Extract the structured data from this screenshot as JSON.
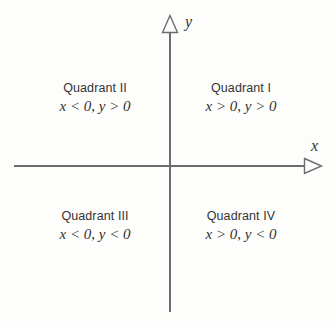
{
  "figure": {
    "background_color": "#fdfdfc",
    "axis_color": "#6d6d6d",
    "text_color": "#333333"
  },
  "axes": {
    "x": {
      "label": "x",
      "arrowhead": "open-triangle-right-icon",
      "direction": "right"
    },
    "y": {
      "label": "y",
      "arrowhead": "open-triangle-up-icon",
      "direction": "up"
    },
    "origin": {
      "x": 170,
      "y": 166
    }
  },
  "quadrants": [
    {
      "id": "quadrant-1",
      "name": "Quadrant I",
      "x_sign": "x > 0",
      "separator": ", ",
      "y_sign": "y > 0",
      "condition": "x > 0, y > 0"
    },
    {
      "id": "quadrant-2",
      "name": "Quadrant II",
      "x_sign": "x < 0",
      "separator": ", ",
      "y_sign": "y > 0",
      "condition": "x < 0, y > 0"
    },
    {
      "id": "quadrant-3",
      "name": "Quadrant III",
      "x_sign": "x < 0",
      "separator": ", ",
      "y_sign": "y < 0",
      "condition": "x < 0, y < 0"
    },
    {
      "id": "quadrant-4",
      "name": "Quadrant IV",
      "x_sign": "x > 0",
      "separator": ", ",
      "y_sign": "y < 0",
      "condition": "x > 0, y < 0"
    }
  ]
}
